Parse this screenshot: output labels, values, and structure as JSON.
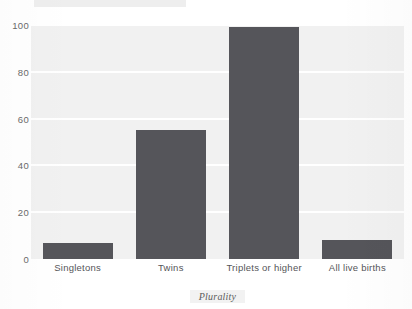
{
  "figure": {
    "title_strip_text": "",
    "background_color": "#ffffff",
    "plot_background_color": "#f1f1f1",
    "gridline_color": "#ffffff",
    "bar_color": "#55555a",
    "tick_label_color": "#6a6a6a",
    "axis_title_color": "#5d5d5d"
  },
  "chart_data": {
    "type": "bar",
    "title": "",
    "xlabel": "Plurality",
    "ylabel": "",
    "categories": [
      "Singletons",
      "Twins",
      "Triplets or higher",
      "All live births"
    ],
    "values": [
      7,
      55,
      99,
      8
    ],
    "ylim": [
      0,
      100
    ],
    "yticks": [
      0,
      20,
      40,
      60,
      80,
      100
    ],
    "ytick_labels": [
      "0",
      "20",
      "40",
      "60",
      "80",
      "100"
    ],
    "grid": true,
    "grid_axis": "y",
    "legend": false,
    "legend_position": "none",
    "orientation": "vertical",
    "series": [
      {
        "name": "",
        "values": [
          7,
          55,
          99,
          8
        ]
      }
    ]
  }
}
